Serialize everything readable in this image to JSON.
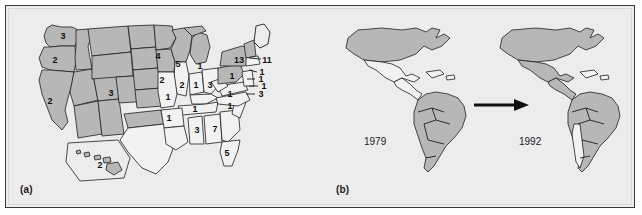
{
  "figure": {
    "panels": [
      {
        "id": "a",
        "label": "(a)"
      },
      {
        "id": "b",
        "label": "(b)"
      }
    ]
  },
  "panel_a": {
    "label": "(a)",
    "caption_note": "United States map with per-state counts",
    "inset_name": "hawaii-inset",
    "state_counts": [
      {
        "state": "WA",
        "value": "3",
        "x": 57,
        "y": 31,
        "shaded": true
      },
      {
        "state": "OR",
        "value": "2",
        "x": 49,
        "y": 55,
        "shaded": true
      },
      {
        "state": "CA",
        "value": "2",
        "x": 44,
        "y": 96,
        "shaded": true
      },
      {
        "state": "CO",
        "value": "3",
        "x": 105,
        "y": 88,
        "shaded": true
      },
      {
        "state": "MN",
        "value": "4",
        "x": 152,
        "y": 51,
        "shaded": true
      },
      {
        "state": "WI",
        "value": "5",
        "x": 172,
        "y": 59,
        "shaded": true
      },
      {
        "state": "MI",
        "value": "1",
        "x": 194,
        "y": 61,
        "shaded": true
      },
      {
        "state": "IA",
        "value": "2",
        "x": 156,
        "y": 75,
        "shaded": true
      },
      {
        "state": "IL",
        "value": "2",
        "x": 176,
        "y": 80,
        "shaded": false
      },
      {
        "state": "IN",
        "value": "1",
        "x": 190,
        "y": 80,
        "shaded": false
      },
      {
        "state": "OH",
        "value": "3",
        "x": 204,
        "y": 80,
        "shaded": false
      },
      {
        "state": "MO",
        "value": "1",
        "x": 162,
        "y": 92,
        "shaded": false
      },
      {
        "state": "AR",
        "value": "1",
        "x": 163,
        "y": 113,
        "shaded": false
      },
      {
        "state": "TN",
        "value": "1",
        "x": 189,
        "y": 104,
        "shaded": false
      },
      {
        "state": "NC",
        "value": "1",
        "x": 224,
        "y": 101,
        "shaded": false
      },
      {
        "state": "MS",
        "value": "3",
        "x": 191,
        "y": 125,
        "shaded": false
      },
      {
        "state": "AL",
        "value": "7",
        "x": 209,
        "y": 124,
        "shaded": false
      },
      {
        "state": "FL",
        "value": "5",
        "x": 221,
        "y": 148,
        "shaded": false
      },
      {
        "state": "PA",
        "value": "1",
        "x": 226,
        "y": 71,
        "shaded": true
      },
      {
        "state": "VA",
        "value": "1",
        "x": 224,
        "y": 89,
        "shaded": false
      },
      {
        "state": "NY",
        "value": "13",
        "x": 233,
        "y": 55,
        "shaded": true
      },
      {
        "state": "HI",
        "value": "2",
        "x": 94,
        "y": 160,
        "shaded": false
      }
    ],
    "leader_labels": [
      {
        "name": "label-11",
        "value": "11",
        "x": 261,
        "y": 55
      },
      {
        "name": "label-ne-1a",
        "value": "1",
        "x": 256,
        "y": 67
      },
      {
        "name": "label-ne-1b",
        "value": "1",
        "x": 252,
        "y": 74
      },
      {
        "name": "label-ne-1c",
        "value": "1",
        "x": 256,
        "y": 81
      },
      {
        "name": "label-ne-3",
        "value": "3",
        "x": 252,
        "y": 89
      }
    ]
  },
  "panel_b": {
    "label": "(b)",
    "caption_note": "Americas coverage comparison",
    "maps": [
      {
        "name": "americas-map-1979",
        "year": "1979"
      },
      {
        "name": "americas-map-1992",
        "year": "1992"
      }
    ],
    "arrow": "→"
  },
  "colors": {
    "shaded_fill": "#b7b7b7",
    "plain_fill": "#f2f2f2",
    "ink": "#1e1e1e",
    "panel_background": "#ececec",
    "frame_border": "#3a3a3a"
  }
}
